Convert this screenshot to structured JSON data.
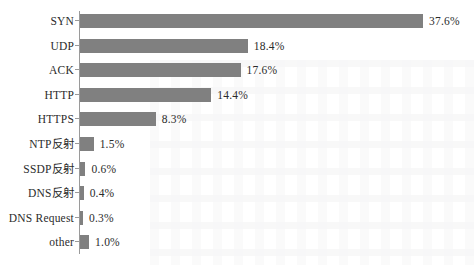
{
  "chart_data": {
    "type": "bar",
    "orientation": "horizontal",
    "title": "",
    "subtitle": "",
    "xlabel": "",
    "ylabel": "",
    "xlim": [
      0,
      37.6
    ],
    "grid": false,
    "legend": null,
    "bar_color": "#808080",
    "text_color": "#2b2b2b",
    "axis_color": "#9a9a9a",
    "background": "#ffffff",
    "value_suffix": "%",
    "categories": [
      "SYN",
      "UDP",
      "ACK",
      "HTTP",
      "HTTPS",
      "NTP反射",
      "SSDP反射",
      "DNS反射",
      "DNS Request",
      "other"
    ],
    "values": [
      37.6,
      18.4,
      17.6,
      14.4,
      8.3,
      1.5,
      0.6,
      0.4,
      0.3,
      1.0
    ],
    "value_labels": [
      "37.6%",
      "18.4%",
      "17.6%",
      "14.4%",
      "8.3%",
      "1.5%",
      "0.6%",
      "0.4%",
      "0.3%",
      "1.0%"
    ]
  }
}
